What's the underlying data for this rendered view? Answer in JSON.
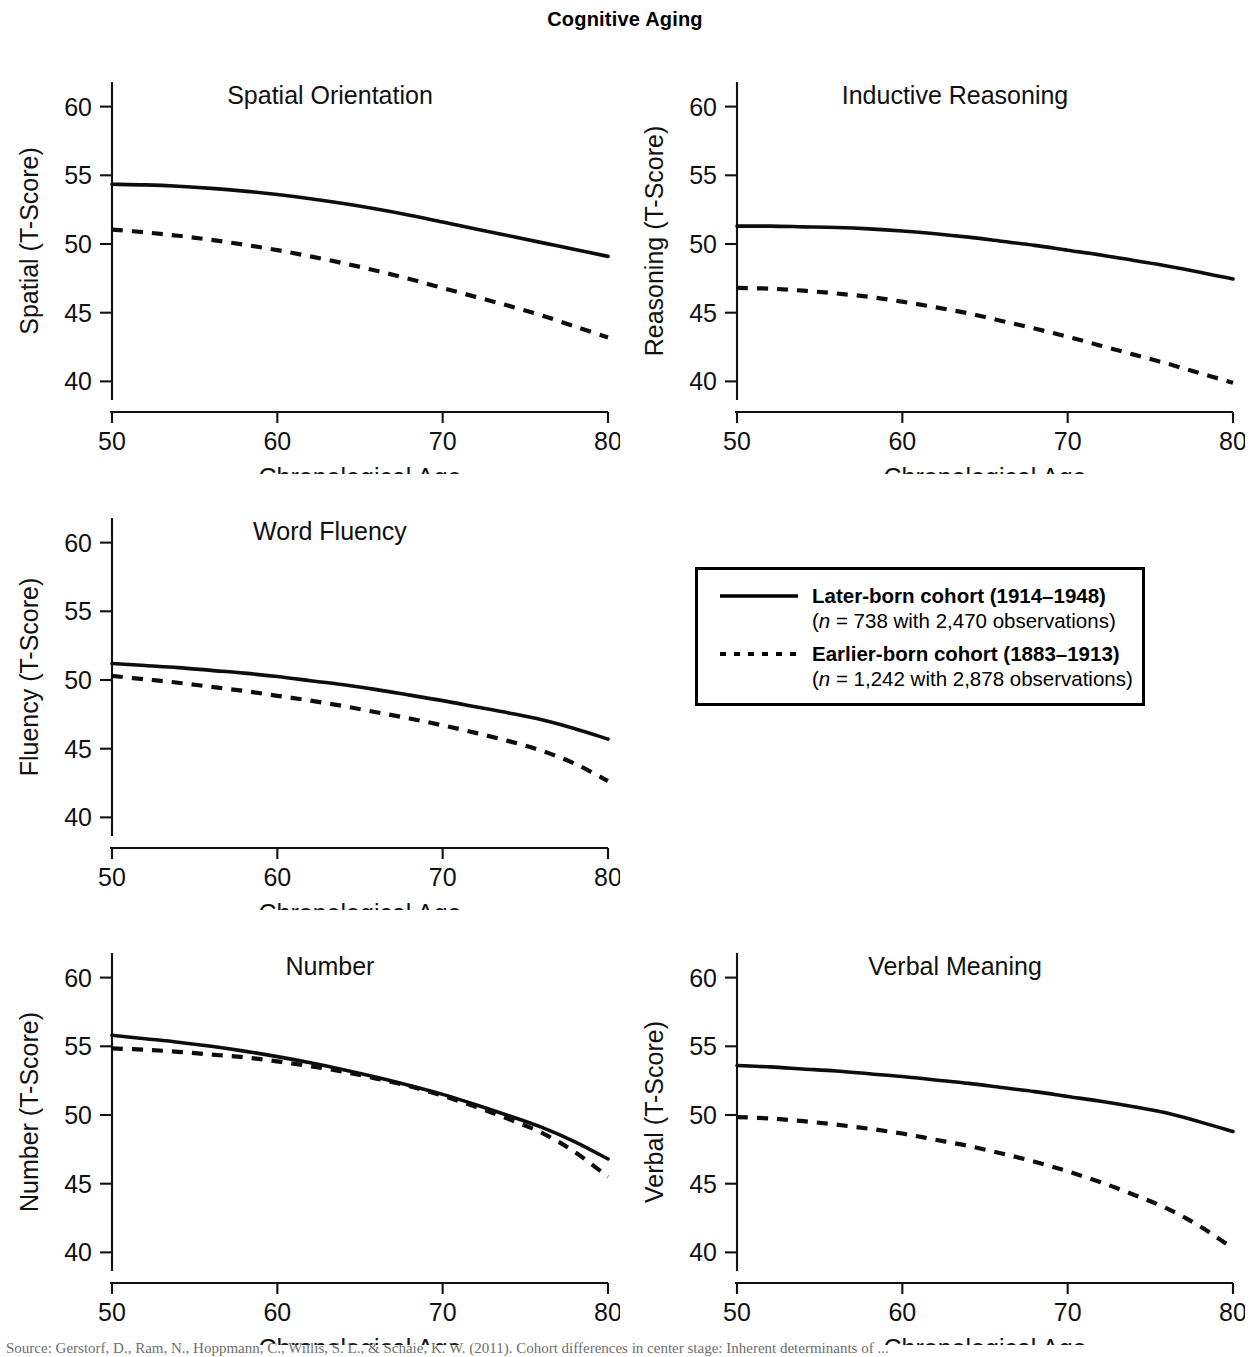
{
  "figure": {
    "title": "Cognitive Aging",
    "bottom_caption": "Source: Gerstorf, D., Ram, N., Hoppmann, C., Willis, S. L., & Schaie, K. W. (2011). Cohort differences in center stage: Inherent determinants of ..."
  },
  "axes": {
    "x_title": "Chronological Age",
    "x_ticks": [
      50,
      60,
      70,
      80
    ],
    "y_ticks": [
      40,
      45,
      50,
      55,
      60
    ],
    "xlim": [
      50,
      80
    ],
    "ylim": [
      38.5,
      61.5
    ]
  },
  "legend": {
    "position": "center-right",
    "entries": [
      {
        "style": "solid",
        "title": "Later-born cohort (1914–1948)",
        "n_prefix": "(",
        "n_symbol": "n",
        "n_text": " = 738 with 2,470 observations)"
      },
      {
        "style": "dashed",
        "title": "Earlier-born cohort (1883–1913)",
        "n_prefix": "(",
        "n_symbol": "n",
        "n_text": " = 1,242 with 2,878 observations)"
      }
    ]
  },
  "chart_data": {
    "type": "line",
    "title": "Cognitive Aging",
    "xlabel": "Chronological Age",
    "grid": false,
    "x": [
      50,
      52,
      54,
      56,
      58,
      60,
      62,
      64,
      66,
      68,
      70,
      72,
      74,
      76,
      78,
      80
    ],
    "panels": [
      {
        "title": "Spatial Orientation",
        "ylabel": "Spatial (T-Score)",
        "ylim": [
          38.5,
          61.5
        ],
        "yticks": [
          40,
          45,
          50,
          55,
          60
        ],
        "series": [
          {
            "name": "Later-born cohort (1914–1948)",
            "style": "solid",
            "values": [
              54.35,
              54.3,
              54.2,
              54.05,
              53.85,
              53.6,
              53.3,
              52.95,
              52.55,
              52.1,
              51.6,
              51.1,
              50.6,
              50.1,
              49.6,
              49.1
            ]
          },
          {
            "name": "Earlier-born cohort (1883–1913)",
            "style": "dashed",
            "values": [
              51.05,
              50.85,
              50.6,
              50.3,
              49.95,
              49.55,
              49.1,
              48.6,
              48.05,
              47.45,
              46.8,
              46.15,
              45.5,
              44.8,
              44.0,
              43.2
            ]
          }
        ]
      },
      {
        "title": "Inductive Reasoning",
        "ylabel": "Reasoning (T-Score)",
        "ylim": [
          38.5,
          61.5
        ],
        "yticks": [
          40,
          45,
          50,
          55,
          60
        ],
        "series": [
          {
            "name": "Later-born cohort (1914–1948)",
            "style": "solid",
            "values": [
              51.3,
              51.3,
              51.25,
              51.2,
              51.1,
              50.95,
              50.75,
              50.5,
              50.2,
              49.9,
              49.55,
              49.2,
              48.8,
              48.4,
              47.95,
              47.45
            ]
          },
          {
            "name": "Earlier-born cohort (1883–1913)",
            "style": "dashed",
            "values": [
              46.8,
              46.75,
              46.6,
              46.4,
              46.15,
              45.8,
              45.4,
              44.95,
              44.4,
              43.85,
              43.25,
              42.6,
              41.95,
              41.3,
              40.6,
              39.9
            ]
          }
        ]
      },
      {
        "title": "Word Fluency",
        "ylabel": "Fluency (T-Score)",
        "ylim": [
          38.5,
          61.5
        ],
        "yticks": [
          40,
          45,
          50,
          55,
          60
        ],
        "series": [
          {
            "name": "Later-born cohort (1914–1948)",
            "style": "solid",
            "values": [
              51.2,
              51.05,
              50.9,
              50.7,
              50.5,
              50.25,
              49.95,
              49.65,
              49.3,
              48.9,
              48.5,
              48.05,
              47.6,
              47.1,
              46.45,
              45.7
            ]
          },
          {
            "name": "Earlier-born cohort (1883–1913)",
            "style": "dashed",
            "values": [
              50.3,
              50.05,
              49.8,
              49.5,
              49.2,
              48.85,
              48.5,
              48.1,
              47.65,
              47.2,
              46.7,
              46.15,
              45.55,
              44.85,
              43.9,
              42.65
            ]
          }
        ]
      },
      {
        "title": "Number",
        "ylabel": "Number (T-Score)",
        "ylim": [
          38.5,
          61.5
        ],
        "yticks": [
          40,
          45,
          50,
          55,
          60
        ],
        "series": [
          {
            "name": "Later-born cohort (1914–1948)",
            "style": "solid",
            "values": [
              55.8,
              55.55,
              55.3,
              55.0,
              54.65,
              54.25,
              53.8,
              53.3,
              52.75,
              52.15,
              51.5,
              50.75,
              49.95,
              49.1,
              48.05,
              46.8
            ]
          },
          {
            "name": "Earlier-born cohort (1883–1913)",
            "style": "dashed",
            "values": [
              54.85,
              54.75,
              54.6,
              54.4,
              54.2,
              53.9,
              53.55,
              53.15,
              52.65,
              52.1,
              51.4,
              50.6,
              49.7,
              48.7,
              47.3,
              45.5
            ]
          }
        ]
      },
      {
        "title": "Verbal Meaning",
        "ylabel": "Verbal (T-Score)",
        "ylim": [
          38.5,
          61.5
        ],
        "yticks": [
          40,
          45,
          50,
          55,
          60
        ],
        "series": [
          {
            "name": "Later-born cohort (1914–1948)",
            "style": "solid",
            "values": [
              53.6,
              53.5,
              53.35,
              53.2,
              53.0,
              52.8,
              52.55,
              52.3,
              52.0,
              51.7,
              51.35,
              51.0,
              50.6,
              50.15,
              49.5,
              48.8
            ]
          },
          {
            "name": "Earlier-born cohort (1883–1913)",
            "style": "dashed",
            "values": [
              49.85,
              49.75,
              49.55,
              49.3,
              49.0,
              48.65,
              48.2,
              47.75,
              47.2,
              46.6,
              45.9,
              45.1,
              44.2,
              43.2,
              41.9,
              40.3
            ]
          }
        ]
      }
    ]
  }
}
